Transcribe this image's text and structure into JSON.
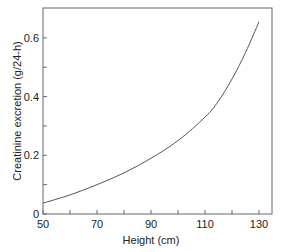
{
  "chart_data": {
    "type": "line",
    "title": "",
    "xlabel": "Height (cm)",
    "ylabel": "Creatinine excretion (g/24-h)",
    "xlim": [
      50,
      135
    ],
    "ylim": [
      0,
      0.7
    ],
    "x_ticks": [
      50,
      70,
      90,
      110,
      130
    ],
    "x_minor_ticks": [
      60,
      80,
      100,
      120
    ],
    "y_ticks": [
      "0",
      "0.2",
      "0.4",
      "0.6"
    ],
    "y_tick_values": [
      0,
      0.2,
      0.4,
      0.6
    ],
    "y_minor_ticks": [
      0.1,
      0.3,
      0.5
    ],
    "grid": false,
    "legend": null,
    "series": [
      {
        "name": "Creatinine excretion",
        "x": [
          50,
          60,
          70,
          80,
          90,
          100,
          110,
          115,
          120,
          125,
          130
        ],
        "values": [
          0.037,
          0.065,
          0.1,
          0.14,
          0.19,
          0.25,
          0.33,
          0.385,
          0.46,
          0.55,
          0.655
        ]
      }
    ]
  }
}
